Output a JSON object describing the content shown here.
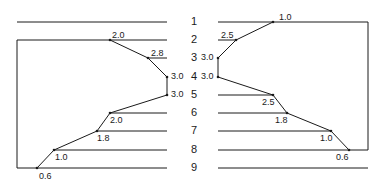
{
  "diagram": {
    "rows": [
      "1",
      "2",
      "3",
      "4",
      "5",
      "6",
      "7",
      "8",
      "9"
    ],
    "left_profile": {
      "points": [
        {
          "row": "2",
          "value": "2.0"
        },
        {
          "row": "3",
          "value": "2.8"
        },
        {
          "row": "4",
          "value": "3.0"
        },
        {
          "row": "5",
          "value": "3.0"
        },
        {
          "row": "6",
          "value": "2.0"
        },
        {
          "row": "7",
          "value": "1.8"
        },
        {
          "row": "8",
          "value": "1.0"
        },
        {
          "row": "9",
          "value": "0.6"
        }
      ]
    },
    "right_profile": {
      "points": [
        {
          "row": "1",
          "value": "1.0"
        },
        {
          "row": "2",
          "value": "2.5"
        },
        {
          "row": "3",
          "value": "3.0"
        },
        {
          "row": "4",
          "value": "3.0"
        },
        {
          "row": "5",
          "value": "2.5"
        },
        {
          "row": "6",
          "value": "1.8"
        },
        {
          "row": "7",
          "value": "1.0"
        },
        {
          "row": "8",
          "value": "0.6"
        }
      ]
    },
    "line_color": "#1a1a1a"
  }
}
